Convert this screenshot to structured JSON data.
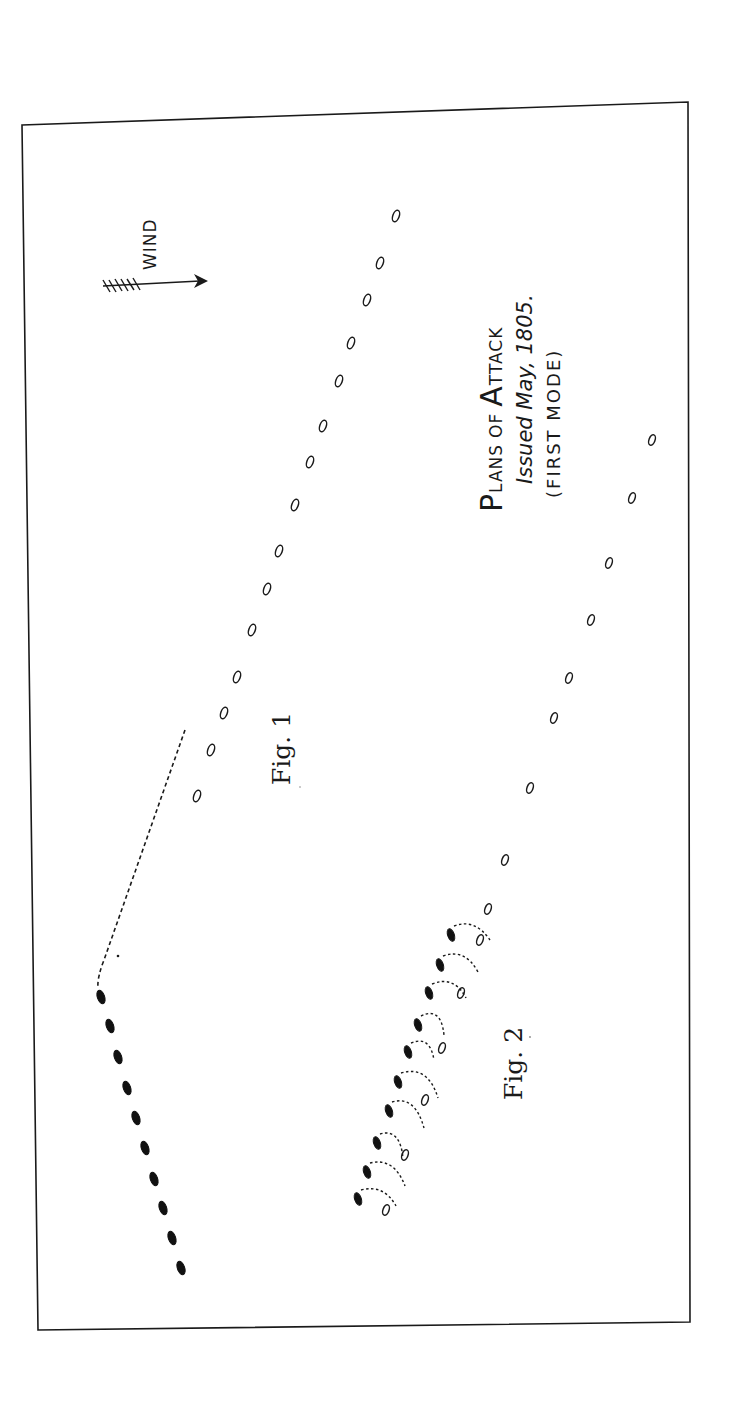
{
  "title": {
    "line1_cap1": "P",
    "line1_small1": "LANS",
    "line1_of": "OF",
    "line1_cap2": "A",
    "line1_small2": "TTACK",
    "line2": "Issued May, 1805.",
    "line3": "(FIRST MODE)"
  },
  "wind": {
    "label": "WIND",
    "icon": "wind-arrow-icon"
  },
  "figures": {
    "fig1": {
      "label": "Fig. 1"
    },
    "fig2": {
      "label": "Fig. 2"
    }
  },
  "colors": {
    "ink": "#1a1a1a",
    "paper": "#ffffff"
  },
  "legend_semantics": {
    "black_ship": "friendly line (filled)",
    "white_ship": "enemy line (outline)"
  }
}
